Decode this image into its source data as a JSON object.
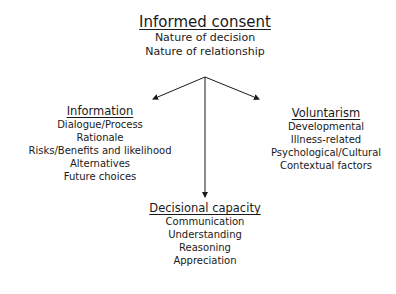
{
  "root": {
    "title": "Informed consent",
    "items": [
      "Nature of decision",
      "Nature of relationship"
    ]
  },
  "branches": {
    "information": {
      "title": "Information",
      "items": [
        "Dialogue/Process",
        "Rationale",
        "Risks/Benefits and likelihood",
        "Alternatives",
        "Future choices"
      ]
    },
    "voluntarism": {
      "title": "Voluntarism",
      "items": [
        "Developmental",
        "Illness-related",
        "Psychological/Cultural",
        "Contextual factors"
      ]
    },
    "decisional_capacity": {
      "title": "Decisional capacity",
      "items": [
        "Communication",
        "Understanding",
        "Reasoning",
        "Appreciation"
      ]
    }
  },
  "colors": {
    "line": "#1a1a1a",
    "text": "#1a1a1a"
  }
}
